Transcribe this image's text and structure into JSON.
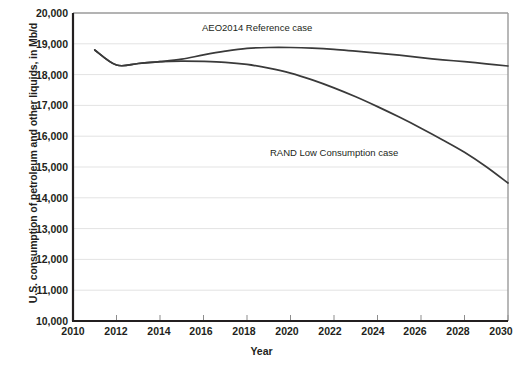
{
  "chart_data": {
    "type": "line",
    "title": "",
    "xlabel": "Year",
    "ylabel": "U.S. consumption of petroleum and other liquids, in Mb/d",
    "xlim": [
      2010,
      2030
    ],
    "ylim": [
      10000,
      20000
    ],
    "grid": true,
    "legend_position": "inline-annotations",
    "xticks": [
      "2010",
      "2012",
      "2014",
      "2016",
      "2018",
      "2020",
      "2022",
      "2024",
      "2026",
      "2028",
      "2030"
    ],
    "yticks": [
      "10,000",
      "11,000",
      "12,000",
      "13,000",
      "14,000",
      "15,000",
      "16,000",
      "17,000",
      "18,000",
      "19,000",
      "20,000"
    ],
    "x": [
      2011,
      2012,
      2013,
      2014,
      2015,
      2016,
      2017,
      2018,
      2019,
      2020,
      2021,
      2022,
      2023,
      2024,
      2025,
      2026,
      2027,
      2028,
      2029,
      2030
    ],
    "series": [
      {
        "name": "AEO2014 Reference case",
        "color": "#3a3a3a",
        "values": [
          18800,
          18310,
          18360,
          18420,
          18500,
          18640,
          18760,
          18850,
          18880,
          18880,
          18860,
          18820,
          18760,
          18700,
          18630,
          18550,
          18480,
          18420,
          18350,
          18280
        ]
      },
      {
        "name": "RAND Low Consumption case",
        "color": "#3a3a3a",
        "values": [
          18800,
          18310,
          18360,
          18420,
          18440,
          18430,
          18400,
          18330,
          18210,
          18050,
          17830,
          17570,
          17280,
          16960,
          16620,
          16260,
          15880,
          15480,
          15010,
          14480
        ]
      }
    ],
    "annotations": [
      {
        "text": "AEO2014 Reference case",
        "x": 2016.8,
        "y": 19150
      },
      {
        "text": "RAND Low Consumption case",
        "x": 2019.7,
        "y": 15580
      }
    ]
  },
  "style": {
    "axis_color": "#231f20",
    "grid_color": "#e3e3e3",
    "line_color": "#3a3a3a",
    "plot_background": "#ffffff",
    "figure_background": "#ffffff"
  }
}
